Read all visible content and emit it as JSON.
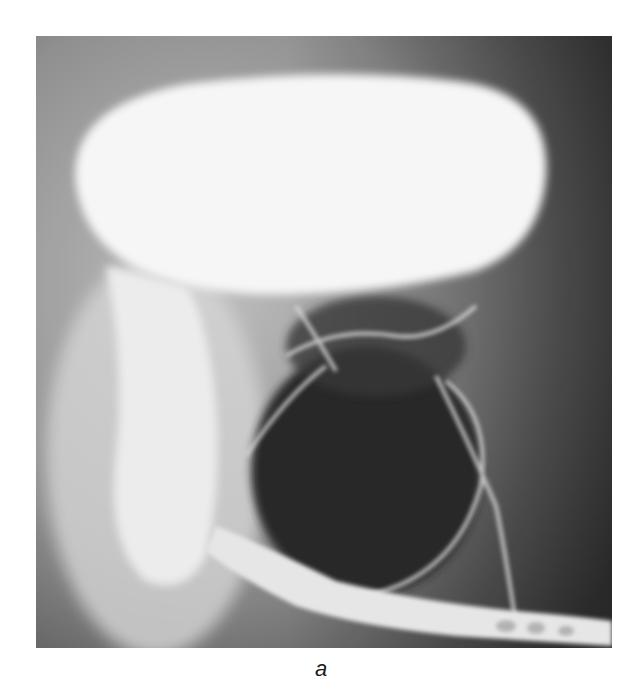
{
  "figure": {
    "panel_label": "a",
    "colors": {
      "background": "#7a7a7a",
      "contrast_fill": "#f7f7f7",
      "dark_region": "#262626",
      "bone_lines": "#d9d9d9"
    }
  }
}
